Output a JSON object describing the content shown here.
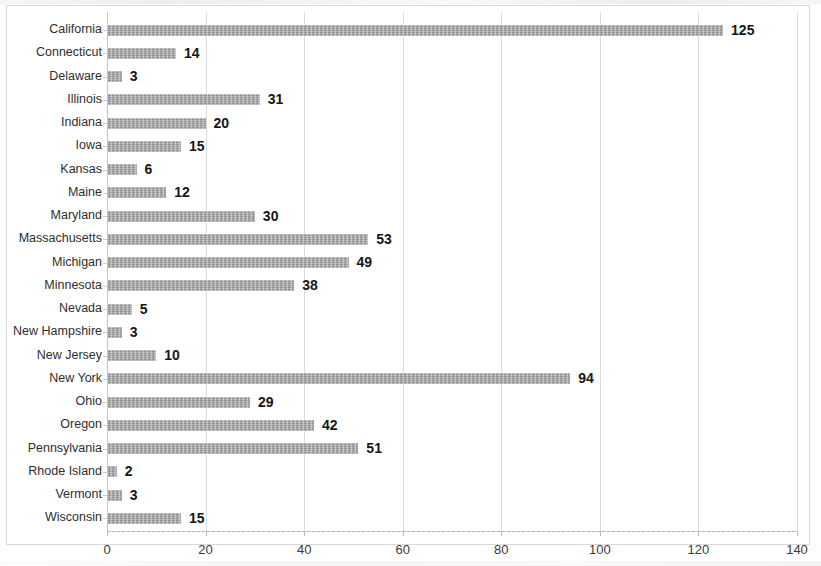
{
  "chart_data": {
    "type": "bar",
    "orientation": "horizontal",
    "title": "",
    "subtitle": "",
    "xlabel": "",
    "ylabel": "",
    "xlim": [
      0,
      140
    ],
    "ylim": null,
    "xticks": [
      0,
      20,
      40,
      60,
      80,
      100,
      120,
      140
    ],
    "xtick_labels": [
      "0",
      "20",
      "40",
      "60",
      "80",
      "100",
      "120",
      "140"
    ],
    "grid": true,
    "grid_axis": "x",
    "legend": null,
    "legend_position": "none",
    "data_labels": true,
    "bar_color": "#9e9e9e",
    "label_color": "#161616",
    "categories": [
      "California",
      "Connecticut",
      "Delaware",
      "Illinois",
      "Indiana",
      "Iowa",
      "Kansas",
      "Maine",
      "Maryland",
      "Massachusetts",
      "Michigan",
      "Minnesota",
      "Nevada",
      "New Hampshire",
      "New Jersey",
      "New York",
      "Ohio",
      "Oregon",
      "Pennsylvania",
      "Rhode Island",
      "Vermont",
      "Wisconsin"
    ],
    "values": [
      125,
      14,
      3,
      31,
      20,
      15,
      6,
      12,
      30,
      53,
      49,
      38,
      5,
      3,
      10,
      94,
      29,
      42,
      51,
      2,
      3,
      15
    ],
    "value_labels": [
      "125",
      "14",
      "3",
      "31",
      "20",
      "15",
      "6",
      "12",
      "30",
      "53",
      "49",
      "38",
      "5",
      "3",
      "10",
      "94",
      "29",
      "42",
      "51",
      "2",
      "3",
      "15"
    ]
  }
}
